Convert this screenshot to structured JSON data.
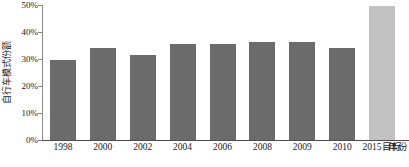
{
  "chart_data": {
    "type": "bar",
    "title": "",
    "subtitle": "",
    "xlabel": "年份",
    "ylabel": "自行车模式份额",
    "categories": [
      "1998",
      "2000",
      "2002",
      "2004",
      "2006",
      "2008",
      "2009",
      "2010",
      "2015目标"
    ],
    "values": [
      29.7,
      34.0,
      31.6,
      35.6,
      35.6,
      36.4,
      36.4,
      34.2,
      49.8
    ],
    "value_labels": [
      "29.7%",
      "34.0%",
      "31.6%",
      "35.6%",
      "35.6%",
      "36.4%",
      "36.4%",
      "34.2%",
      "49.8%"
    ],
    "ylim": [
      0,
      50
    ],
    "y_ticks": [
      0,
      10,
      20,
      30,
      40,
      50
    ],
    "y_tick_labels": [
      "0%",
      "10%",
      "20%",
      "30%",
      "40%",
      "50%"
    ],
    "grid": false,
    "legend": "none",
    "series": [
      {
        "name": "自行车模式份额",
        "values": [
          29.7,
          34.0,
          31.6,
          35.6,
          35.6,
          36.4,
          36.4,
          34.2,
          49.8
        ]
      }
    ],
    "bar_colors": [
      "#6b6b6b",
      "#6b6b6b",
      "#6b6b6b",
      "#6b6b6b",
      "#6b6b6b",
      "#6b6b6b",
      "#6b6b6b",
      "#6b6b6b",
      "#c2c2c2"
    ],
    "colors": {
      "bar_actual": "#6b6b6b",
      "bar_target": "#c2c2c2",
      "axis": "#4d4d4d",
      "text": "#1a1a1a",
      "background": "#ffffff"
    }
  }
}
